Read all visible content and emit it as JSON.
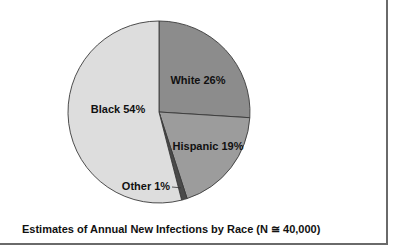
{
  "chart_data": {
    "type": "pie",
    "title": "Estimates of Annual New Infections by Race (N ≅ 40,000)",
    "start_angle_deg": 0,
    "direction": "clockwise",
    "slices": [
      {
        "name": "White",
        "value": 26,
        "label": "White 26%",
        "color": "#8c8c8c"
      },
      {
        "name": "Hispanic",
        "value": 19,
        "label": "Hispanic 19%",
        "color": "#9c9c9c"
      },
      {
        "name": "Other",
        "value": 1,
        "label": "Other 1%",
        "color": "#4a4a4a"
      },
      {
        "name": "Black",
        "value": 54,
        "label": "Black 54%",
        "color": "#dddddd"
      }
    ],
    "outline_color": "#3a3a3a",
    "legend": "none"
  }
}
